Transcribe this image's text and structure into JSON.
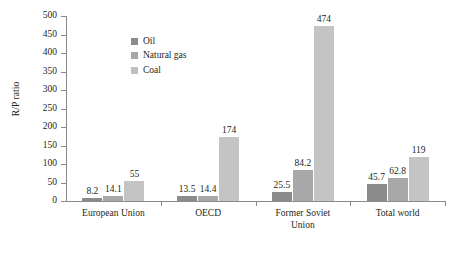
{
  "chart_data": {
    "type": "bar",
    "title": "",
    "xlabel": "",
    "ylabel": "R/P ratio",
    "ylim": [
      0,
      500
    ],
    "yticks": [
      0,
      50,
      100,
      150,
      200,
      250,
      300,
      350,
      400,
      450,
      500
    ],
    "grid": false,
    "legend_position": "upper-left-inside",
    "categories": [
      "European Union",
      "OECD",
      "Former Soviet Union",
      "Total world"
    ],
    "category_lines": [
      [
        "European Union"
      ],
      [
        "OECD"
      ],
      [
        "Former Soviet",
        "Union"
      ],
      [
        "Total world"
      ]
    ],
    "series": [
      {
        "name": "Oil",
        "color": "#8b8b8b",
        "values": [
          8.2,
          13.5,
          25.5,
          45.7
        ],
        "labels": [
          "8.2",
          "13.5",
          "25.5",
          "45.7"
        ]
      },
      {
        "name": "Natural gas",
        "color": "#a8a8a8",
        "values": [
          14.1,
          14.4,
          84.2,
          62.8
        ],
        "labels": [
          "14.1",
          "14.4",
          "84.2",
          "62.8"
        ]
      },
      {
        "name": "Coal",
        "color": "#c4c4c4",
        "values": [
          55,
          174,
          474,
          119
        ],
        "labels": [
          "55",
          "174",
          "474",
          "119"
        ]
      }
    ]
  },
  "axis": {
    "y_title": "R/P ratio",
    "tick_labels": [
      "500",
      "450",
      "400",
      "350",
      "300",
      "250",
      "200",
      "150",
      "100",
      "50",
      "0"
    ]
  },
  "legend": {
    "items": [
      {
        "label": "Oil",
        "swatch": "#8b8b8b"
      },
      {
        "label": "Natural gas",
        "swatch": "#a8a8a8"
      },
      {
        "label": "Coal",
        "swatch": "#bfbfbf"
      }
    ]
  }
}
